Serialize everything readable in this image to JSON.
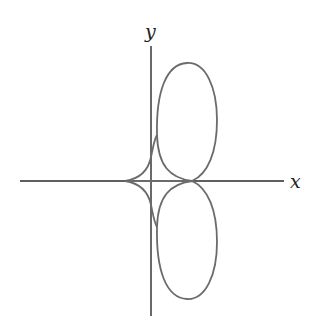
{
  "diagram": {
    "type": "parametric-curve-plot",
    "axes": {
      "x_label": "x",
      "y_label": "y",
      "color": "#222222"
    },
    "curve": {
      "color": "#6b6b6b",
      "description": "Symmetric curve with two loops (upper and lower) to the right of the y-axis, cusps on the x-axis"
    }
  }
}
